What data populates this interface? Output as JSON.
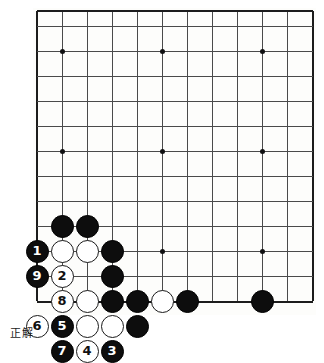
{
  "image": {
    "kind": "go-board-diagram",
    "width": 324,
    "height": 341,
    "background_color": "#ffffff"
  },
  "caption": {
    "text": "正解",
    "x": 10,
    "y": 324
  },
  "board": {
    "line_color": "#4a4a4a",
    "edge_color": "#1c1c1c",
    "surface_color": "#fdfdfb",
    "cell_size": 25,
    "origin_x": 37,
    "origin_y": 11,
    "cols": 12,
    "rows": 13,
    "x_lines": [
      37,
      62,
      87,
      112,
      137,
      162,
      187,
      212,
      237,
      262,
      287,
      312
    ],
    "y_lines": [
      11,
      26,
      51,
      76,
      101,
      126,
      151,
      176,
      201,
      226,
      251,
      276,
      301
    ],
    "edges": {
      "left": 37,
      "right": 312,
      "top": 11,
      "bottom": 301
    },
    "hoshi": [
      {
        "x": 62,
        "y": 51
      },
      {
        "x": 162,
        "y": 51
      },
      {
        "x": 262,
        "y": 51
      },
      {
        "x": 62,
        "y": 151
      },
      {
        "x": 162,
        "y": 151
      },
      {
        "x": 262,
        "y": 151
      },
      {
        "x": 62,
        "y": 251
      },
      {
        "x": 162,
        "y": 251
      },
      {
        "x": 262,
        "y": 251
      }
    ]
  },
  "stones": [
    {
      "id": "b-62-226",
      "color": "black",
      "x": 62,
      "y": 226,
      "label": ""
    },
    {
      "id": "b-87-226",
      "color": "black",
      "x": 87,
      "y": 226,
      "label": ""
    },
    {
      "id": "b-37-251",
      "color": "black",
      "x": 37,
      "y": 251,
      "label": "1"
    },
    {
      "id": "w-62-251",
      "color": "white",
      "x": 62,
      "y": 251,
      "label": ""
    },
    {
      "id": "w-87-251",
      "color": "white",
      "x": 87,
      "y": 251,
      "label": ""
    },
    {
      "id": "b-112-251",
      "color": "black",
      "x": 112,
      "y": 251,
      "label": ""
    },
    {
      "id": "b-37-276",
      "color": "black",
      "x": 37,
      "y": 276,
      "label": "9"
    },
    {
      "id": "w-62-276",
      "color": "white",
      "x": 62,
      "y": 276,
      "label": "2"
    },
    {
      "id": "b-112-276",
      "color": "black",
      "x": 112,
      "y": 276,
      "label": ""
    },
    {
      "id": "w-62-301",
      "color": "white",
      "x": 62,
      "y": 301,
      "label": "8"
    },
    {
      "id": "w-87-301",
      "color": "white",
      "x": 87,
      "y": 301,
      "label": ""
    },
    {
      "id": "b-112-301",
      "color": "black",
      "x": 112,
      "y": 301,
      "label": ""
    },
    {
      "id": "b-137-301",
      "color": "black",
      "x": 137,
      "y": 301,
      "label": ""
    },
    {
      "id": "w-162-301",
      "color": "white",
      "x": 162,
      "y": 301,
      "label": ""
    },
    {
      "id": "b-187-301",
      "color": "black",
      "x": 187,
      "y": 301,
      "label": ""
    },
    {
      "id": "b-262-301",
      "color": "black",
      "x": 262,
      "y": 301,
      "label": ""
    },
    {
      "id": "w-37-326",
      "color": "white",
      "x": 37,
      "y": 326,
      "label": "6"
    },
    {
      "id": "b-62-326",
      "color": "black",
      "x": 62,
      "y": 326,
      "label": "5"
    },
    {
      "id": "w-87-326",
      "color": "white",
      "x": 87,
      "y": 326,
      "label": ""
    },
    {
      "id": "w-112-326",
      "color": "white",
      "x": 112,
      "y": 326,
      "label": ""
    },
    {
      "id": "b-137-326",
      "color": "black",
      "x": 137,
      "y": 326,
      "label": ""
    },
    {
      "id": "b-62-351",
      "color": "black",
      "x": 62,
      "y": 351,
      "label": "7"
    },
    {
      "id": "w-87-351",
      "color": "white",
      "x": 87,
      "y": 351,
      "label": "4"
    },
    {
      "id": "b-112-351",
      "color": "black",
      "x": 112,
      "y": 351,
      "label": "3"
    }
  ]
}
